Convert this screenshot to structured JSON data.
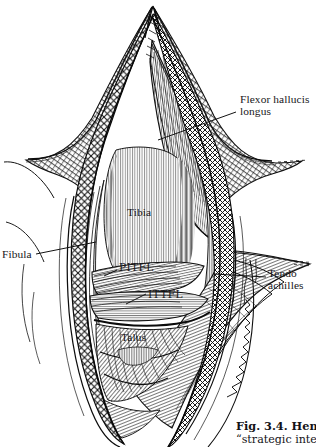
{
  "figure": {
    "kind": "anatomical-line-engraving",
    "background_color": "#ffffff",
    "ink_color": "#111111"
  },
  "labels": [
    {
      "id": "flexor-hallucis-longus",
      "line1": "Flexor hallucis",
      "line2": "longus",
      "leader": true
    },
    {
      "id": "fibula",
      "text": "Fibula",
      "leader": true
    },
    {
      "id": "tendo-achilles",
      "line1": "Tendo",
      "line2": "achilles",
      "leader": true
    },
    {
      "id": "tibia",
      "text": "Tibia",
      "leader": false
    },
    {
      "id": "pitfl",
      "text": "PITFL",
      "leader": true
    },
    {
      "id": "ittfl",
      "text": "ITTFL",
      "leader": true
    },
    {
      "id": "talus",
      "text": "Talus",
      "leader": false
    }
  ],
  "label_text": {
    "flexor_hallucis_longus_line1": "Flexor hallucis",
    "flexor_hallucis_longus_line2": "longus",
    "fibula": "Fibula",
    "tendo_achilles_line1": "Tendo",
    "tendo_achilles_line2": "achilles",
    "tibia": "Tibia",
    "pitfl": "PITFL",
    "ittfl": "ITTFL",
    "talus": "Talus"
  },
  "caption": {
    "line1": "Fig. 3.4. Henry",
    "line2": "“strategic interva"
  }
}
